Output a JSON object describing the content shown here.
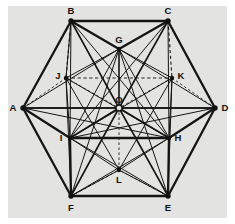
{
  "figure": {
    "width": 235,
    "height": 224,
    "colors": {
      "background": "#ffffff",
      "plate": "#e3e3e1",
      "line": "#151515",
      "hidden_line": "#222222",
      "label": "#111111",
      "node_fill": "#121212",
      "center_node_fill": "#e3e3e1"
    },
    "plate": {
      "x": 8,
      "y": 6,
      "width": 219,
      "height": 212
    },
    "vertices": [
      {
        "id": "A",
        "x": 23,
        "y": 108,
        "label": "A",
        "label_x": 13,
        "label_y": 108,
        "marker": "filled",
        "ring": "outer"
      },
      {
        "id": "B",
        "x": 71,
        "y": 21,
        "label": "B",
        "label_x": 71,
        "label_y": 11,
        "marker": "filled",
        "ring": "outer"
      },
      {
        "id": "C",
        "x": 168,
        "y": 21,
        "label": "C",
        "label_x": 168,
        "label_y": 11,
        "marker": "filled",
        "ring": "outer"
      },
      {
        "id": "D",
        "x": 215,
        "y": 108,
        "label": "D",
        "label_x": 225,
        "label_y": 108,
        "marker": "filled",
        "ring": "outer"
      },
      {
        "id": "E",
        "x": 168,
        "y": 196,
        "label": "E",
        "label_x": 168,
        "label_y": 208,
        "marker": "filled",
        "ring": "outer"
      },
      {
        "id": "F",
        "x": 71,
        "y": 196,
        "label": "F",
        "label_x": 71,
        "label_y": 208,
        "marker": "filled",
        "ring": "outer"
      },
      {
        "id": "G",
        "x": 119,
        "y": 49,
        "label": "G",
        "label_x": 119,
        "label_y": 40,
        "marker": "filled",
        "ring": "inner"
      },
      {
        "id": "H",
        "x": 169,
        "y": 138,
        "label": "H",
        "label_x": 178,
        "label_y": 138,
        "marker": "filled",
        "ring": "inner"
      },
      {
        "id": "I",
        "x": 70,
        "y": 138,
        "label": "I",
        "label_x": 61,
        "label_y": 138,
        "marker": "filled",
        "ring": "inner"
      },
      {
        "id": "J",
        "x": 66,
        "y": 78,
        "label": "J",
        "label_x": 58,
        "label_y": 76,
        "marker": "filled",
        "ring": "inner"
      },
      {
        "id": "K",
        "x": 172,
        "y": 78,
        "label": "K",
        "label_x": 181,
        "label_y": 76,
        "marker": "filled",
        "ring": "inner"
      },
      {
        "id": "L",
        "x": 119,
        "y": 170,
        "label": "L",
        "label_x": 119,
        "label_y": 180,
        "marker": "filled",
        "ring": "inner"
      },
      {
        "id": "O",
        "x": 119,
        "y": 108,
        "label": "O",
        "label_x": 119,
        "label_y": 100,
        "marker": "open",
        "ring": "center"
      }
    ],
    "edges_outer_hexagon": [
      {
        "from": "A",
        "to": "B",
        "style": "solid",
        "weight": "thick"
      },
      {
        "from": "B",
        "to": "C",
        "style": "solid",
        "weight": "thick"
      },
      {
        "from": "C",
        "to": "D",
        "style": "solid",
        "weight": "thick"
      },
      {
        "from": "D",
        "to": "E",
        "style": "solid",
        "weight": "thick"
      },
      {
        "from": "E",
        "to": "F",
        "style": "solid",
        "weight": "thick"
      },
      {
        "from": "F",
        "to": "A",
        "style": "solid",
        "weight": "thick"
      }
    ],
    "edges_cube_visible": [
      {
        "from": "A",
        "to": "I",
        "style": "solid",
        "weight": "thick"
      },
      {
        "from": "B",
        "to": "G",
        "style": "solid",
        "weight": "thick"
      },
      {
        "from": "C",
        "to": "G",
        "style": "solid",
        "weight": "thick"
      },
      {
        "from": "D",
        "to": "H",
        "style": "solid",
        "weight": "thick"
      },
      {
        "from": "E",
        "to": "H",
        "style": "solid",
        "weight": "thick"
      },
      {
        "from": "F",
        "to": "I",
        "style": "solid",
        "weight": "thick"
      },
      {
        "from": "I",
        "to": "H",
        "style": "solid",
        "weight": "thick"
      },
      {
        "from": "G",
        "to": "O",
        "style": "solid",
        "weight": "med"
      },
      {
        "from": "I",
        "to": "O",
        "style": "solid",
        "weight": "med"
      },
      {
        "from": "H",
        "to": "O",
        "style": "solid",
        "weight": "med"
      }
    ],
    "edges_cube_hidden": [
      {
        "from": "B",
        "to": "J",
        "style": "dashed",
        "weight": "dash"
      },
      {
        "from": "C",
        "to": "K",
        "style": "dashed",
        "weight": "dash"
      },
      {
        "from": "J",
        "to": "K",
        "style": "dashed",
        "weight": "dash"
      },
      {
        "from": "A",
        "to": "J",
        "style": "dashed",
        "weight": "dash-fine"
      },
      {
        "from": "D",
        "to": "K",
        "style": "dashed",
        "weight": "dash-fine"
      },
      {
        "from": "F",
        "to": "L",
        "style": "dashed",
        "weight": "dash-fine"
      },
      {
        "from": "E",
        "to": "L",
        "style": "dashed",
        "weight": "dash-fine"
      },
      {
        "from": "L",
        "to": "O",
        "style": "dashed",
        "weight": "dash-fine"
      },
      {
        "from": "J",
        "to": "O",
        "style": "dashed",
        "weight": "dash-fine"
      },
      {
        "from": "K",
        "to": "O",
        "style": "dashed",
        "weight": "dash-fine"
      }
    ],
    "edges_diagonals": [
      {
        "from": "A",
        "to": "D",
        "style": "solid",
        "weight": "med"
      },
      {
        "from": "B",
        "to": "O",
        "style": "solid",
        "weight": "med"
      },
      {
        "from": "C",
        "to": "O",
        "style": "solid",
        "weight": "med"
      },
      {
        "from": "E",
        "to": "O",
        "style": "solid",
        "weight": "med"
      },
      {
        "from": "F",
        "to": "O",
        "style": "solid",
        "weight": "med"
      },
      {
        "from": "A",
        "to": "O",
        "style": "solid",
        "weight": "med"
      },
      {
        "from": "D",
        "to": "O",
        "style": "solid",
        "weight": "med"
      },
      {
        "from": "B",
        "to": "I",
        "style": "solid",
        "weight": "thin"
      },
      {
        "from": "B",
        "to": "H",
        "style": "solid",
        "weight": "thin"
      },
      {
        "from": "C",
        "to": "I",
        "style": "solid",
        "weight": "thin"
      },
      {
        "from": "C",
        "to": "H",
        "style": "solid",
        "weight": "thin"
      },
      {
        "from": "F",
        "to": "G",
        "style": "solid",
        "weight": "thin"
      },
      {
        "from": "E",
        "to": "G",
        "style": "solid",
        "weight": "thin"
      },
      {
        "from": "A",
        "to": "G",
        "style": "solid",
        "weight": "thin"
      },
      {
        "from": "D",
        "to": "G",
        "style": "solid",
        "weight": "thin"
      },
      {
        "from": "A",
        "to": "H",
        "style": "solid",
        "weight": "thin"
      },
      {
        "from": "D",
        "to": "I",
        "style": "solid",
        "weight": "thin"
      },
      {
        "from": "F",
        "to": "H",
        "style": "solid",
        "weight": "thin"
      },
      {
        "from": "E",
        "to": "I",
        "style": "solid",
        "weight": "thin"
      },
      {
        "from": "G",
        "to": "I",
        "style": "solid",
        "weight": "thin"
      },
      {
        "from": "G",
        "to": "H",
        "style": "solid",
        "weight": "thin"
      },
      {
        "from": "B",
        "to": "J",
        "style": "solid",
        "weight": "thin"
      },
      {
        "from": "J",
        "to": "I",
        "style": "solid",
        "weight": "thin"
      },
      {
        "from": "K",
        "to": "H",
        "style": "solid",
        "weight": "thin"
      },
      {
        "from": "J",
        "to": "G",
        "style": "solid",
        "weight": "thin"
      },
      {
        "from": "K",
        "to": "G",
        "style": "solid",
        "weight": "thin"
      },
      {
        "from": "J",
        "to": "H",
        "style": "solid",
        "weight": "thin"
      },
      {
        "from": "K",
        "to": "I",
        "style": "solid",
        "weight": "thin"
      },
      {
        "from": "J",
        "to": "L",
        "style": "solid",
        "weight": "thin"
      },
      {
        "from": "K",
        "to": "L",
        "style": "solid",
        "weight": "thin"
      },
      {
        "from": "L",
        "to": "I",
        "style": "solid",
        "weight": "thin"
      },
      {
        "from": "L",
        "to": "H",
        "style": "solid",
        "weight": "thin"
      },
      {
        "from": "F",
        "to": "L",
        "style": "solid",
        "weight": "thin"
      },
      {
        "from": "E",
        "to": "L",
        "style": "solid",
        "weight": "thin"
      },
      {
        "from": "J",
        "to": "F",
        "style": "solid",
        "weight": "thin"
      },
      {
        "from": "K",
        "to": "E",
        "style": "solid",
        "weight": "thin"
      }
    ]
  }
}
